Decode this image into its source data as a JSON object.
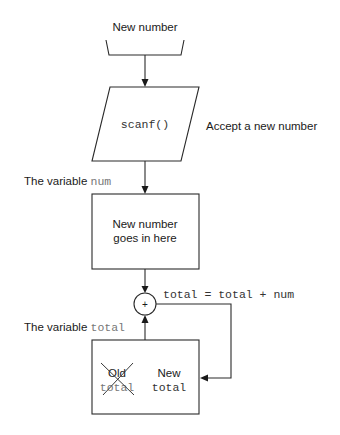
{
  "diagram": {
    "input_label": "New number",
    "scanf_label": "scanf()",
    "scanf_note": "Accept a new number",
    "num_variable": {
      "prefix": "The variable ",
      "name": "num"
    },
    "num_box": {
      "line1": "New number",
      "line2": "goes in here"
    },
    "adder_symbol": "+",
    "equation": "total = total + num",
    "total_variable": {
      "prefix": "The variable ",
      "name": "total"
    },
    "total_box": {
      "old_word": "Old",
      "old_value": "total",
      "new_word": "New",
      "new_value": "total"
    }
  }
}
